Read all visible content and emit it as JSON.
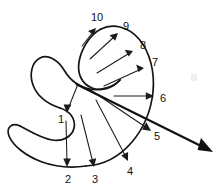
{
  "figure": {
    "background_color": "#ffffff",
    "stroke_color": "#151515",
    "label_color": "#101010",
    "width": 224,
    "height": 190
  },
  "labels": [
    {
      "id": "label-1",
      "text": "1",
      "x": 61,
      "y": 120
    },
    {
      "id": "label-2",
      "text": "2",
      "x": 68,
      "y": 180
    },
    {
      "id": "label-3",
      "text": "3",
      "x": 95,
      "y": 180
    },
    {
      "id": "label-4",
      "text": "4",
      "x": 130,
      "y": 172
    },
    {
      "id": "label-5",
      "text": "5",
      "x": 157,
      "y": 137
    },
    {
      "id": "label-6",
      "text": "6",
      "x": 163,
      "y": 99
    },
    {
      "id": "label-7",
      "text": "7",
      "x": 155,
      "y": 63
    },
    {
      "id": "label-8",
      "text": "8",
      "x": 143,
      "y": 46
    },
    {
      "id": "label-9",
      "text": "9",
      "x": 126,
      "y": 27
    },
    {
      "id": "label-10",
      "text": "10",
      "x": 97,
      "y": 18
    }
  ],
  "vectors": [
    {
      "id": "vector-1",
      "label": "1",
      "from_x": 78,
      "from_y": 84,
      "to_x": 68,
      "to_y": 111
    },
    {
      "id": "vector-2",
      "label": "2",
      "from_x": 66,
      "from_y": 120,
      "to_x": 67,
      "to_y": 166
    },
    {
      "id": "vector-3",
      "label": "3",
      "from_x": 80,
      "from_y": 114,
      "to_x": 94,
      "to_y": 166
    },
    {
      "id": "vector-4",
      "label": "4",
      "from_x": 96,
      "from_y": 100,
      "to_x": 128,
      "to_y": 160
    },
    {
      "id": "vector-5",
      "label": "5",
      "from_x": 89,
      "from_y": 89,
      "to_x": 150,
      "to_y": 130
    },
    {
      "id": "vector-6",
      "label": "6",
      "from_x": 114,
      "from_y": 96,
      "to_x": 153,
      "to_y": 96
    },
    {
      "id": "vector-7",
      "label": "7",
      "from_x": 104,
      "from_y": 86,
      "to_x": 143,
      "to_y": 68
    },
    {
      "id": "vector-8",
      "label": "8",
      "from_x": 97,
      "from_y": 72,
      "to_x": 132,
      "to_y": 51
    },
    {
      "id": "vector-9",
      "label": "9",
      "from_x": 90,
      "from_y": 58,
      "to_x": 117,
      "to_y": 34
    },
    {
      "id": "vector-10",
      "label": "10",
      "from_x": 82,
      "from_y": 45,
      "to_x": 95,
      "to_y": 29
    }
  ],
  "tangent_arrow": {
    "id": "tangent-arrow",
    "from_x": 76,
    "from_y": 84,
    "to_x": 212,
    "to_y": 152,
    "style": "thick"
  },
  "curve": {
    "id": "closed-curve",
    "description": "Self-winding closed curve with an upper elongated lobe, a middle hook and a lower-left narrow lobe",
    "path": "M 99 33 C 88 38, 80 50, 80 62 C 80 74, 86 84, 97 88 C 112 94, 128 92, 140 80 C 152 68, 158 50, 152 36 C 146 22, 128 16, 114 20 C 104 23, 100 28, 99 33 Z"
  }
}
